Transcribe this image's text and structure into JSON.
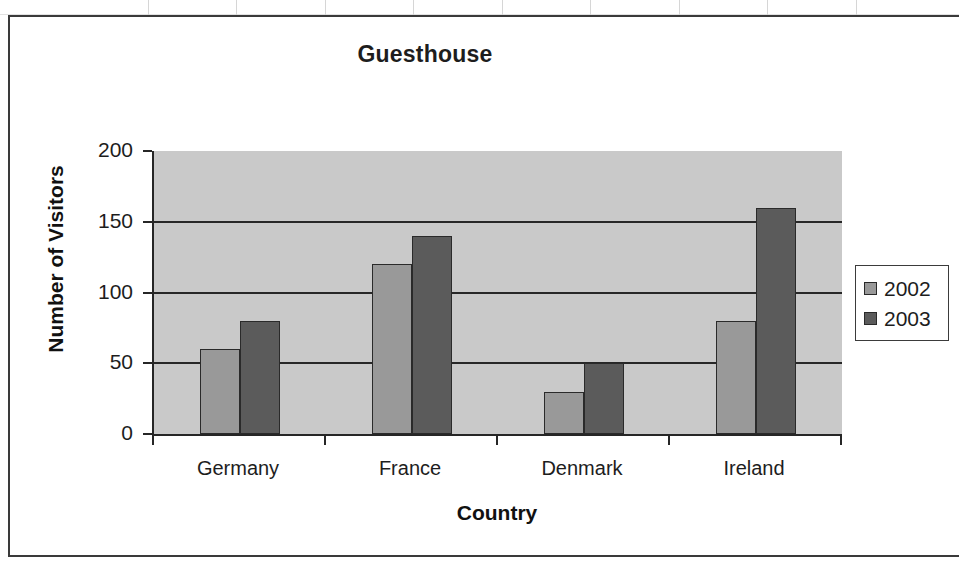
{
  "chart_data": {
    "type": "bar",
    "title": "Guesthouse",
    "xlabel": "Country",
    "ylabel": "Number of Visitors",
    "categories": [
      "Germany",
      "France",
      "Denmark",
      "Ireland"
    ],
    "series": [
      {
        "name": "2002",
        "values": [
          60,
          120,
          30,
          80
        ],
        "color": "#999999"
      },
      {
        "name": "2003",
        "values": [
          80,
          140,
          50,
          160
        ],
        "color": "#5b5b5b"
      }
    ],
    "ylim": [
      0,
      200
    ],
    "yticks": [
      0,
      50,
      100,
      150,
      200
    ],
    "ytick_labels": [
      "0",
      "50",
      "100",
      "150",
      "200"
    ],
    "grid": true,
    "legend_position": "right",
    "plot_background": "#c9c9c9"
  },
  "legend": {
    "entries": [
      {
        "label": "2002",
        "color": "#999999"
      },
      {
        "label": "2003",
        "color": "#5b5b5b"
      }
    ]
  }
}
